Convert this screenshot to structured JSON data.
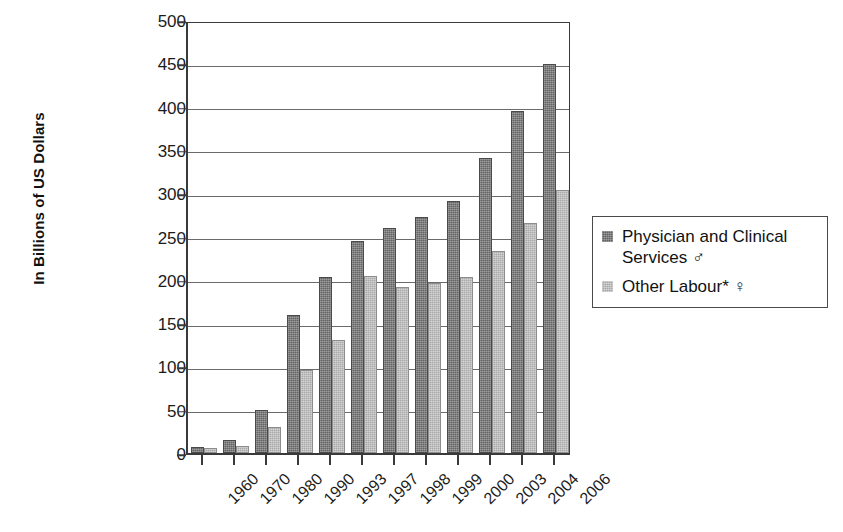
{
  "chart_data": {
    "type": "bar",
    "title": "",
    "xlabel": "",
    "ylabel": "In Billions of US Dollars",
    "ylim": [
      0,
      500
    ],
    "ytick_step": 50,
    "yticks": [
      "0",
      "50",
      "100",
      "150",
      "200",
      "250",
      "300",
      "350",
      "400",
      "450",
      "500"
    ],
    "grid": true,
    "legend_position": "right",
    "categories": [
      "1960",
      "1970",
      "1980",
      "1990",
      "1993",
      "1997",
      "1998",
      "1999",
      "2000",
      "2003",
      "2004",
      "2006"
    ],
    "series": [
      {
        "name": "Physician and Clinical Services ♂",
        "swatch": "s1",
        "color": "#636363",
        "values": [
          5,
          13,
          47,
          157,
          201,
          242,
          257,
          270,
          289,
          338,
          393,
          447
        ]
      },
      {
        "name": "Other Labour* ♀",
        "swatch": "s2",
        "color": "#a9a9a9",
        "values": [
          3,
          6,
          28,
          93,
          128,
          202,
          189,
          194,
          201,
          231,
          263,
          301
        ]
      }
    ]
  },
  "legend": {
    "items": [
      {
        "label": "Physician and Clinical Services ♂",
        "swatch": "s1"
      },
      {
        "label": "Other Labour* ♀",
        "swatch": "s2"
      }
    ]
  },
  "axes": {
    "y_title": "In Billions of US Dollars"
  }
}
